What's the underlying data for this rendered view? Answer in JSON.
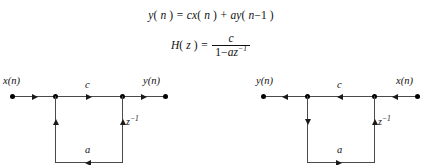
{
  "equations": {
    "difference_equation": {
      "lhs_var": "y",
      "lhs_arg": "n",
      "text": "y( n ) = cx( n ) + ay( n−1 )",
      "parts": {
        "y": "y",
        "open1": "( ",
        "n1": "n",
        "close1": " )",
        "equals": " = ",
        "c": "c",
        "x": "x",
        "open2": "( ",
        "n2": "n",
        "close2": " )",
        "plus": " + ",
        "a": "a",
        "y2": "y",
        "open3": "( ",
        "n3": "n",
        "minus": "−1",
        "close3": " )"
      }
    },
    "transfer_function": {
      "text": "H( z ) = c / ( 1 − az⁻¹ )",
      "parts": {
        "H": "H",
        "open1": "( ",
        "z": "z",
        "close1": " )",
        "equals": " = ",
        "numerator": "c",
        "den_one": "1",
        "den_minus": "−",
        "den_a": "a",
        "den_z": "z",
        "den_exp": "−1"
      }
    }
  },
  "diagrams": [
    {
      "id": "direct-form",
      "name": "direct-form-signal-flow-graph",
      "input_label": "x(n)",
      "output_label": "y(n)",
      "gain_label": "c",
      "feedback_label": "a",
      "delay_label": "z",
      "delay_exponent": "−1",
      "left_terminal": "x(n)",
      "right_terminal": "y(n)",
      "flow_direction": "left-to-right",
      "top_arrow_directions": [
        "right",
        "right",
        "right"
      ],
      "left_branch_arrow": "up",
      "right_branch_arrow": "up",
      "bottom_arrow": "left"
    },
    {
      "id": "transposed-form",
      "name": "transposed-form-signal-flow-graph",
      "input_label": "x(n)",
      "output_label": "y(n)",
      "gain_label": "c",
      "feedback_label": "a",
      "delay_label": "z",
      "delay_exponent": "−1",
      "left_terminal": "y(n)",
      "right_terminal": "x(n)",
      "flow_direction": "right-to-left",
      "top_arrow_directions": [
        "left",
        "left",
        "left"
      ],
      "left_branch_arrow": "down",
      "right_branch_arrow": "up",
      "bottom_arrow": "right"
    }
  ],
  "colors": {
    "background": "#ffffff",
    "ink": "#111111",
    "line": "#4a4a4a",
    "node": "#000000"
  }
}
